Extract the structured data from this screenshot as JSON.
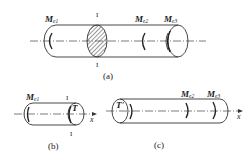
{
  "figure": {
    "a": {
      "caption": "(a)",
      "labels": {
        "me1": {
          "main": "M",
          "sub": "e1"
        },
        "me2": {
          "main": "M",
          "sub": "e2"
        },
        "me3": {
          "main": "M",
          "sub": "e3"
        },
        "section_top": "I",
        "section_bottom": "I"
      }
    },
    "b": {
      "caption": "(b)",
      "labels": {
        "me1": {
          "main": "M",
          "sub": "e1"
        },
        "torque": "T",
        "section_top": "I",
        "section_bottom": "I",
        "axis": "x"
      }
    },
    "c": {
      "caption": "(c)",
      "labels": {
        "torque": "T'",
        "me2": {
          "main": "M",
          "sub": "e2"
        },
        "me3": {
          "main": "M",
          "sub": "e3"
        },
        "axis": "x"
      }
    }
  },
  "colors": {
    "stroke": "#333333",
    "background": "#ffffff"
  }
}
